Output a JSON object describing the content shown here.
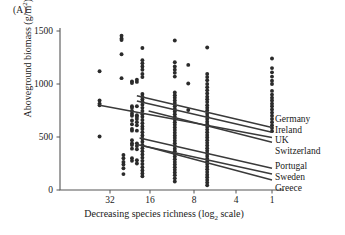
{
  "panel": {
    "label": "(A)"
  },
  "axes": {
    "ylabel_text": "Aboveground biomass (g/m",
    "ylabel_sup": "2",
    "ylabel_tail": ")",
    "xlabel_head": "Decreasing species richness (log",
    "xlabel_sub": "2",
    "xlabel_tail": " scale)",
    "yticks": [
      "0",
      "500",
      "1000",
      "1500"
    ],
    "xticks": [
      "32",
      "16",
      "8",
      "4",
      "1"
    ]
  },
  "legend": {
    "group1": [
      "Germany",
      "Ireland",
      "UK",
      "Switzerland"
    ],
    "group2": [
      "Portugal",
      "Sweden",
      "Greece"
    ]
  },
  "colors": {
    "ink": "#1a1a1a",
    "axis": "#555555",
    "point": "#2b2b2b",
    "line": "#3a3a3a"
  },
  "chart_data": {
    "type": "scatter",
    "title": "(A)",
    "xlabel": "Decreasing species richness (log2 scale)",
    "ylabel": "Aboveground biomass (g/m2)",
    "ylim": [
      0,
      1500
    ],
    "yticks": [
      0,
      500,
      1000,
      1500
    ],
    "x_axis_scale": "log2-decreasing",
    "x_tick_values": [
      32,
      16,
      8,
      4,
      1
    ],
    "x_tick_px": [
      110,
      150,
      194,
      236,
      272
    ],
    "grid": false,
    "legend_position": "right-of-plot-at-x=1",
    "series": [
      {
        "name": "Germany",
        "type": "regression-line",
        "x_start": 18,
        "y_start": 890,
        "x_end": 1,
        "y_end": 590
      },
      {
        "name": "Ireland",
        "type": "regression-line",
        "x_start": 18,
        "y_start": 840,
        "x_end": 1,
        "y_end": 545
      },
      {
        "name": "UK",
        "type": "regression-line",
        "x_start": 40,
        "y_start": 800,
        "x_end": 1,
        "y_end": 495
      },
      {
        "name": "Switzerland",
        "type": "regression-line",
        "x_start": 14,
        "y_start": 745,
        "x_end": 1,
        "y_end": 450
      },
      {
        "name": "Portugal",
        "type": "regression-line",
        "x_start": 17,
        "y_start": 490,
        "x_end": 1,
        "y_end": 205
      },
      {
        "name": "Sweden",
        "type": "regression-line",
        "x_start": 18,
        "y_start": 430,
        "x_end": 1,
        "y_end": 150
      },
      {
        "name": "Greece",
        "type": "regression-line",
        "x_start": 16,
        "y_start": 420,
        "x_end": 1,
        "y_end": 95
      }
    ],
    "points": [
      [
        40,
        1120
      ],
      [
        40,
        845
      ],
      [
        40,
        815
      ],
      [
        40,
        800
      ],
      [
        40,
        505
      ],
      [
        25,
        1455
      ],
      [
        25,
        1430
      ],
      [
        25,
        1415
      ],
      [
        25,
        1280
      ],
      [
        25,
        1055
      ],
      [
        24,
        330
      ],
      [
        24,
        300
      ],
      [
        24,
        265
      ],
      [
        24,
        240
      ],
      [
        24,
        205
      ],
      [
        24,
        150
      ],
      [
        20,
        1025
      ],
      [
        20,
        1010
      ],
      [
        20,
        790
      ],
      [
        20,
        775
      ],
      [
        20,
        745
      ],
      [
        20,
        720
      ],
      [
        20,
        700
      ],
      [
        20,
        655
      ],
      [
        20,
        620
      ],
      [
        20,
        575
      ],
      [
        20,
        560
      ],
      [
        20,
        470
      ],
      [
        20,
        440
      ],
      [
        20,
        425
      ],
      [
        20,
        390
      ],
      [
        20,
        300
      ],
      [
        20,
        275
      ],
      [
        18,
        1040
      ],
      [
        18,
        1020
      ],
      [
        18,
        790
      ],
      [
        18,
        705
      ],
      [
        18,
        690
      ],
      [
        18,
        670
      ],
      [
        18,
        640
      ],
      [
        18,
        610
      ],
      [
        18,
        560
      ],
      [
        18,
        440
      ],
      [
        18,
        415
      ],
      [
        18,
        385
      ],
      [
        18,
        280
      ],
      [
        18,
        250
      ],
      [
        16,
        1340
      ],
      [
        16,
        1225
      ],
      [
        16,
        1195
      ],
      [
        16,
        1165
      ],
      [
        16,
        1135
      ],
      [
        16,
        1095
      ],
      [
        16,
        1065
      ],
      [
        16,
        905
      ],
      [
        16,
        880
      ],
      [
        16,
        855
      ],
      [
        16,
        835
      ],
      [
        16,
        805
      ],
      [
        16,
        775
      ],
      [
        16,
        745
      ],
      [
        16,
        715
      ],
      [
        16,
        690
      ],
      [
        16,
        660
      ],
      [
        16,
        630
      ],
      [
        16,
        600
      ],
      [
        16,
        575
      ],
      [
        16,
        545
      ],
      [
        16,
        515
      ],
      [
        16,
        485
      ],
      [
        16,
        455
      ],
      [
        16,
        425
      ],
      [
        16,
        395
      ],
      [
        16,
        365
      ],
      [
        16,
        335
      ],
      [
        16,
        305
      ],
      [
        16,
        275
      ],
      [
        16,
        245
      ],
      [
        16,
        215
      ],
      [
        16,
        185
      ],
      [
        16,
        155
      ],
      [
        16,
        130
      ],
      [
        8,
        1410
      ],
      [
        8,
        1205
      ],
      [
        8,
        1165
      ],
      [
        8,
        1135
      ],
      [
        8,
        1105
      ],
      [
        8,
        1070
      ],
      [
        8,
        920
      ],
      [
        8,
        895
      ],
      [
        8,
        870
      ],
      [
        8,
        845
      ],
      [
        8,
        820
      ],
      [
        8,
        790
      ],
      [
        8,
        765
      ],
      [
        8,
        740
      ],
      [
        8,
        715
      ],
      [
        8,
        690
      ],
      [
        8,
        665
      ],
      [
        8,
        640
      ],
      [
        8,
        615
      ],
      [
        8,
        590
      ],
      [
        8,
        565
      ],
      [
        8,
        540
      ],
      [
        8,
        515
      ],
      [
        8,
        490
      ],
      [
        8,
        465
      ],
      [
        8,
        440
      ],
      [
        8,
        415
      ],
      [
        8,
        390
      ],
      [
        8,
        365
      ],
      [
        8,
        340
      ],
      [
        8,
        315
      ],
      [
        8,
        290
      ],
      [
        8,
        265
      ],
      [
        8,
        240
      ],
      [
        8,
        215
      ],
      [
        8,
        190
      ],
      [
        8,
        165
      ],
      [
        8,
        140
      ],
      [
        8,
        110
      ],
      [
        8,
        80
      ],
      [
        6,
        1180
      ],
      [
        6,
        1005
      ],
      [
        6,
        755
      ],
      [
        4,
        1345
      ],
      [
        4,
        1095
      ],
      [
        4,
        1065
      ],
      [
        4,
        1035
      ],
      [
        4,
        1000
      ],
      [
        4,
        970
      ],
      [
        4,
        940
      ],
      [
        4,
        910
      ],
      [
        4,
        880
      ],
      [
        4,
        855
      ],
      [
        4,
        830
      ],
      [
        4,
        800
      ],
      [
        4,
        775
      ],
      [
        4,
        750
      ],
      [
        4,
        720
      ],
      [
        4,
        695
      ],
      [
        4,
        670
      ],
      [
        4,
        645
      ],
      [
        4,
        620
      ],
      [
        4,
        595
      ],
      [
        4,
        570
      ],
      [
        4,
        545
      ],
      [
        4,
        520
      ],
      [
        4,
        495
      ],
      [
        4,
        470
      ],
      [
        4,
        445
      ],
      [
        4,
        420
      ],
      [
        4,
        395
      ],
      [
        4,
        370
      ],
      [
        4,
        345
      ],
      [
        4,
        320
      ],
      [
        4,
        295
      ],
      [
        4,
        270
      ],
      [
        4,
        245
      ],
      [
        4,
        220
      ],
      [
        4,
        195
      ],
      [
        4,
        170
      ],
      [
        4,
        145
      ],
      [
        4,
        120
      ],
      [
        4,
        95
      ],
      [
        4,
        70
      ],
      [
        4,
        45
      ],
      [
        1,
        1240
      ],
      [
        1,
        1150
      ],
      [
        1,
        1110
      ],
      [
        1,
        1070
      ],
      [
        1,
        1030
      ],
      [
        1,
        1000
      ],
      [
        1,
        935
      ],
      [
        1,
        900
      ],
      [
        1,
        870
      ],
      [
        1,
        845
      ],
      [
        1,
        815
      ],
      [
        1,
        790
      ],
      [
        1,
        760
      ],
      [
        1,
        730
      ],
      [
        1,
        700
      ],
      [
        1,
        670
      ],
      [
        1,
        640
      ],
      [
        1,
        610
      ],
      [
        1,
        585
      ],
      [
        1,
        555
      ]
    ]
  }
}
